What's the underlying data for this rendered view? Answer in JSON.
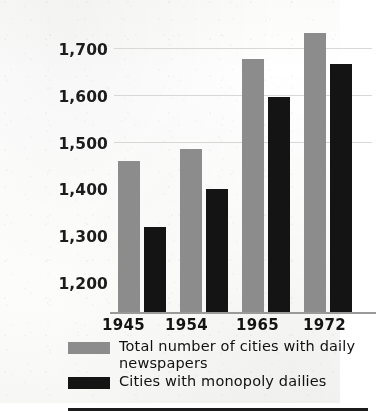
{
  "chart_data": {
    "type": "bar",
    "title": "",
    "subtitle": "",
    "xlabel": "",
    "ylabel": "",
    "categories": [
      "1945",
      "1954",
      "1965",
      "1972"
    ],
    "series": [
      {
        "name": "Total number of cities with daily newspapers",
        "color": "#8c8c8c",
        "values": [
          1460,
          1485,
          1675,
          1730
        ]
      },
      {
        "name": "Cities with monopoly dailies",
        "color": "#141414",
        "values": [
          1320,
          1400,
          1595,
          1665
        ]
      }
    ],
    "yticks": [
      "1,700",
      "1,600",
      "1,500",
      "1,400",
      "1,300",
      "1,200"
    ],
    "ytick_values": [
      1700,
      1600,
      1500,
      1400,
      1300,
      1200
    ],
    "ylim": [
      1140,
      1750
    ],
    "grid": true,
    "legend_position": "bottom-left"
  },
  "axis": {
    "y_labels": [
      "1,700",
      "1,600",
      "1,500",
      "1,400",
      "1,300",
      "1,200"
    ],
    "x_labels": [
      "1945",
      "1954",
      "1965",
      "1972"
    ]
  },
  "legend": {
    "items": [
      {
        "label": "Total number of cities with daily newspapers",
        "swatch": "#8c8c8c"
      },
      {
        "label": "Cities with monopoly dailies",
        "swatch": "#141414"
      }
    ]
  },
  "colors": {
    "series_total": "#8c8c8c",
    "series_monopoly": "#141414",
    "gridline": "#d8d8d6",
    "baseline": "#9a9a98",
    "rule": "#1b1b1b",
    "text": "#141414",
    "page": "#ffffff"
  }
}
